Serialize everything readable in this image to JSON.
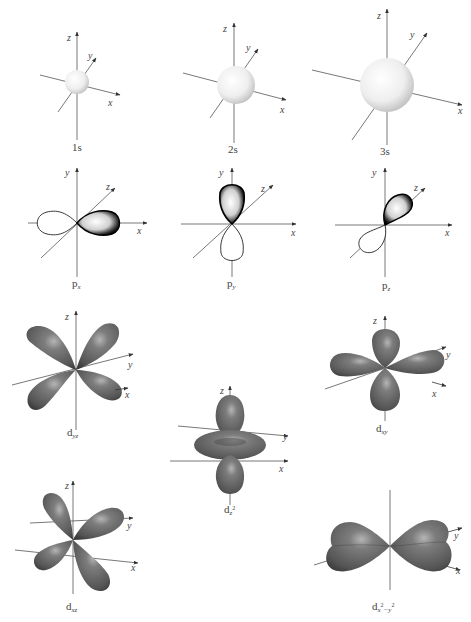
{
  "figure": {
    "axis_labels": {
      "x": "x",
      "y": "y",
      "z": "z"
    },
    "colors": {
      "axis": "#555555",
      "s_sphere_light": "#ffffff",
      "s_sphere_dark": "#bfbfbf",
      "p_outline": "#1a1a1a",
      "d_lobe_light": "#9a9a9a",
      "d_lobe_dark": "#4a4a4a",
      "background": "#ffffff"
    },
    "rows": [
      {
        "name": "s-orbitals",
        "orbitals": [
          {
            "id": "1s",
            "label": "1s",
            "type": "s",
            "relative_size": 1
          },
          {
            "id": "2s",
            "label": "2s",
            "type": "s",
            "relative_size": 2
          },
          {
            "id": "3s",
            "label": "3s",
            "type": "s",
            "relative_size": 3
          }
        ]
      },
      {
        "name": "p-orbitals",
        "orbitals": [
          {
            "id": "px",
            "label_main": "p",
            "label_sub": "x",
            "type": "p",
            "axis": "x"
          },
          {
            "id": "py",
            "label_main": "p",
            "label_sub": "y",
            "type": "p",
            "axis": "y"
          },
          {
            "id": "pz",
            "label_main": "p",
            "label_sub": "z",
            "type": "p",
            "axis": "z"
          }
        ]
      },
      {
        "name": "d-orbitals",
        "orbitals": [
          {
            "id": "dyz",
            "label_main": "d",
            "label_sub": "yz",
            "type": "d"
          },
          {
            "id": "dz2",
            "label_main": "d",
            "label_sub": "z",
            "label_sup": "2",
            "type": "d"
          },
          {
            "id": "dxy",
            "label_main": "d",
            "label_sub": "xy",
            "type": "d"
          },
          {
            "id": "dxz",
            "label_main": "d",
            "label_sub": "xz",
            "type": "d"
          },
          {
            "id": "dx2y2",
            "label_main": "d",
            "label_sub": "x",
            "label_sup": "2",
            "label_sub2": "−y",
            "label_sup2": "2",
            "type": "d"
          }
        ]
      }
    ]
  }
}
